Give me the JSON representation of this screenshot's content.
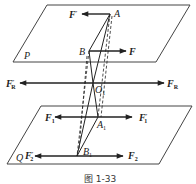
{
  "figure": {
    "caption": "图 1-33",
    "planes": [
      {
        "label": "P",
        "points": [
          [
            47,
            5
          ],
          [
            190,
            5
          ],
          [
            156,
            62
          ],
          [
            13,
            62
          ]
        ]
      },
      {
        "label": "Q",
        "points": [
          [
            41,
            106
          ],
          [
            192,
            106
          ],
          [
            159,
            164
          ],
          [
            7,
            164
          ]
        ]
      }
    ],
    "points": {
      "A": {
        "label": "A",
        "x": 110,
        "y": 14
      },
      "B": {
        "label": "B",
        "x": 89,
        "y": 51
      },
      "O1": {
        "label": "O",
        "sub": "1",
        "x": 93,
        "y": 83
      },
      "A1": {
        "label": "A",
        "sub": "1",
        "x": 98,
        "y": 117
      },
      "B1": {
        "label": "B",
        "sub": "1",
        "x": 77,
        "y": 156
      }
    },
    "forces": {
      "F_prime": {
        "label": "F",
        "sup": "′",
        "from": [
          110,
          14
        ],
        "to": [
          82,
          14
        ]
      },
      "F": {
        "label": "F",
        "from": [
          89,
          51
        ],
        "to": [
          126,
          51
        ]
      },
      "FR_prime": {
        "label": "F",
        "sup": "′",
        "sub": "R",
        "from": [
          93,
          83
        ],
        "to": [
          20,
          83
        ]
      },
      "FR": {
        "label": "F",
        "sub": "R",
        "from": [
          93,
          83
        ],
        "to": [
          164,
          83
        ]
      },
      "F1": {
        "label": "F",
        "sub": "1",
        "from": [
          98,
          117
        ],
        "to": [
          55,
          117
        ]
      },
      "F1_prime": {
        "label": "F",
        "sup": "′",
        "sub": "1",
        "from": [
          98,
          117
        ],
        "to": [
          132,
          117
        ]
      },
      "F2_prime": {
        "label": "F",
        "sup": "′",
        "sub": "2",
        "from": [
          77,
          156
        ],
        "to": [
          35,
          156
        ]
      },
      "F2": {
        "label": "F",
        "sub": "2",
        "from": [
          77,
          156
        ],
        "to": [
          123,
          156
        ]
      }
    },
    "colors": {
      "line": "#222222",
      "plane": "#444444",
      "background": "#ffffff"
    }
  }
}
